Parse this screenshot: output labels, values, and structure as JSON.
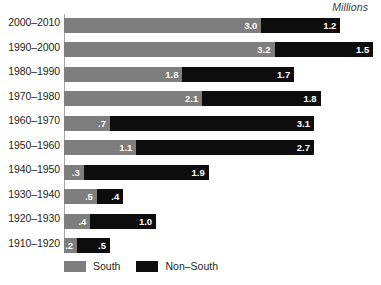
{
  "chart_data": {
    "type": "bar",
    "subtype": "stacked-horizontal",
    "title": "",
    "units_label": "Millions",
    "xlabel": "",
    "ylabel": "",
    "xlim": [
      0,
      4.8
    ],
    "grid": false,
    "legend_position": "bottom-left",
    "categories": [
      "2000–2010",
      "1990–2000",
      "1980–1990",
      "1970–1980",
      "1960–1970",
      "1950–1960",
      "1940–1950",
      "1930–1940",
      "1920–1930",
      "1910–1920"
    ],
    "series": [
      {
        "name": "South",
        "color": "#7e7e7e",
        "values": [
          3.0,
          3.2,
          1.8,
          2.1,
          0.7,
          1.1,
          0.3,
          0.5,
          0.4,
          0.2
        ],
        "labels": [
          "3.0",
          "3.2",
          "1.8",
          "2.1",
          ".7",
          "1.1",
          ".3",
          ".5",
          ".4",
          ".2"
        ]
      },
      {
        "name": "Non–South",
        "color": "#0d0d0d",
        "values": [
          1.2,
          1.5,
          1.7,
          1.8,
          3.1,
          2.7,
          1.9,
          0.4,
          1.0,
          0.5
        ],
        "labels": [
          "1.2",
          "1.5",
          "1.7",
          "1.8",
          "3.1",
          "2.7",
          "1.9",
          ".4",
          "1.0",
          ".5"
        ]
      }
    ]
  },
  "legend": {
    "items": [
      {
        "label": "South"
      },
      {
        "label": "Non–South"
      }
    ]
  }
}
